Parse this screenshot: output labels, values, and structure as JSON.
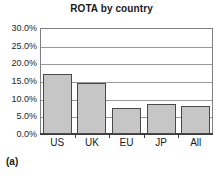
{
  "caption": "(a)",
  "chart_data": {
    "type": "bar",
    "title": "ROTA by country",
    "xlabel": "",
    "ylabel": "",
    "categories": [
      "US",
      "UK",
      "EU",
      "JP",
      "All"
    ],
    "values": [
      17.0,
      14.3,
      7.4,
      8.5,
      7.9
    ],
    "value_labels": [
      "17.0%",
      "14.3%",
      "7.4%",
      "8.5%",
      "7.9%"
    ],
    "ylim": [
      0.0,
      30.0
    ],
    "ytick_values": [
      0.0,
      5.0,
      10.0,
      15.0,
      20.0,
      25.0,
      30.0
    ],
    "ytick_labels": [
      "0.0%",
      "5.0%",
      "10.0%",
      "15.0%",
      "20.0%",
      "25.0%",
      "30.0%"
    ],
    "grid": true,
    "legend": false,
    "legend_position": "none",
    "bar_color": "#c6c6c6",
    "bar_border_color": "#4a4a4a",
    "gridline_color": "#9a9a9a",
    "axis_color": "#3d3d3d",
    "text_color": "#1a1a1a",
    "background": "#ffffff"
  }
}
